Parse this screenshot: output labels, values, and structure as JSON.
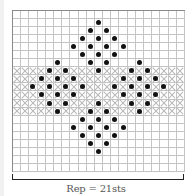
{
  "chart_data": {
    "type": "knitting-chart",
    "columns": 21,
    "rows": 20,
    "row_order": "top-to-bottom",
    "cross_hatched_rows": [
      7,
      8,
      9,
      10,
      11,
      12
    ],
    "dots_by_row": [
      [],
      [
        10
      ],
      [
        9,
        11
      ],
      [
        8,
        10,
        12
      ],
      [
        7,
        9,
        11,
        13
      ],
      [
        8,
        10,
        12
      ],
      [
        5,
        9,
        11,
        15
      ],
      [
        4,
        6,
        10,
        14,
        16
      ],
      [
        3,
        5,
        7,
        13,
        15,
        17
      ],
      [
        2,
        4,
        6,
        8,
        12,
        14,
        16,
        18
      ],
      [
        3,
        5,
        7,
        13,
        15,
        17
      ],
      [
        4,
        6,
        10,
        14,
        16
      ],
      [
        5,
        9,
        11,
        15
      ],
      [
        8,
        10,
        12
      ],
      [
        7,
        9,
        11,
        13
      ],
      [
        8,
        10,
        12
      ],
      [
        9,
        11
      ],
      [
        10
      ],
      [],
      []
    ],
    "legend": {
      "dot": "filled-circle",
      "cross_hatch": "x-cross-band"
    },
    "repeat_label": "Rep = 21sts"
  },
  "colors": {
    "grid_line": "#c4c4c4",
    "grid_border": "#8a8a8a",
    "dot": "#111111",
    "cross": "#b8b8b8",
    "label": "#555555"
  },
  "layout": {
    "cell_width": 8.19,
    "cell_height": 8.05
  }
}
